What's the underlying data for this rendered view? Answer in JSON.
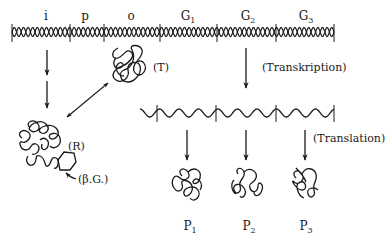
{
  "diagram": {
    "dna": {
      "segments": [
        {
          "label": "i",
          "subscript": ""
        },
        {
          "label": "p",
          "subscript": ""
        },
        {
          "label": "o",
          "subscript": ""
        },
        {
          "label": "G",
          "subscript": "1"
        },
        {
          "label": "G",
          "subscript": "2"
        },
        {
          "label": "G",
          "subscript": "3"
        }
      ]
    },
    "mrna": {
      "segments": 3
    },
    "molecules": {
      "repressor_bound": {
        "label": "(T)"
      },
      "repressor_free": {
        "label": "(R)"
      },
      "inducer": {
        "label": "(β.G.)"
      }
    },
    "processes": {
      "transcription": "(Transkription)",
      "translation": "(Translation)"
    },
    "proteins": [
      {
        "label": "P",
        "subscript": "1"
      },
      {
        "label": "P",
        "subscript": "2"
      },
      {
        "label": "P",
        "subscript": "3"
      }
    ],
    "colors": {
      "ink": "#1a1a1a",
      "background": "#ffffff"
    }
  }
}
